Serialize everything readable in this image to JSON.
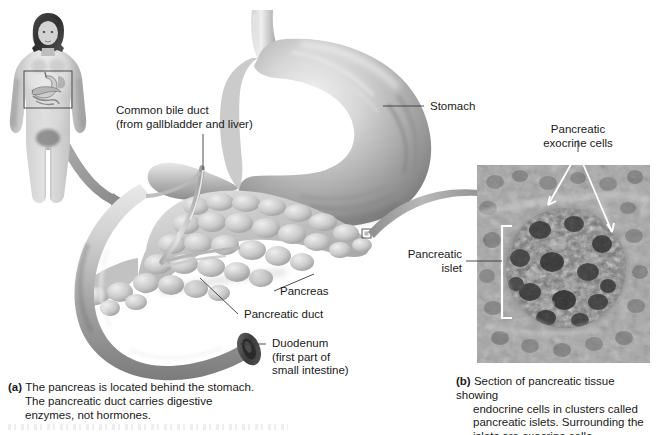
{
  "figure": {
    "background_color": "#ffffff",
    "width": 656,
    "height": 435
  },
  "panel_a": {
    "labels": [
      {
        "name": "common-bile-duct",
        "lines": [
          "Common bile duct",
          "(from gallbladder and liver)"
        ],
        "text": "Common bile duct\n(from gallbladder and liver)"
      },
      {
        "name": "stomach",
        "lines": [
          "Stomach"
        ],
        "text": "Stomach"
      },
      {
        "name": "pancreas",
        "lines": [
          "Pancreas"
        ],
        "text": "Pancreas"
      },
      {
        "name": "pancreatic-duct",
        "lines": [
          "Pancreatic duct"
        ],
        "text": "Pancreatic duct"
      },
      {
        "name": "duodenum",
        "lines": [
          "Duodenum",
          "(first part of",
          "small intestine)"
        ],
        "text": "Duodenum\n(first part of\nsmall intestine)"
      }
    ],
    "caption": {
      "letter": "(a)",
      "line1": "The pancreas is located behind the stomach.",
      "line2": "The pancreatic duct carries digestive",
      "line3": "enzymes, not hormones."
    },
    "body_figure": {
      "name": "human-body-diagram",
      "description": "Grayscale full-body female figure with abdominal inset box and curved arrow"
    }
  },
  "panel_b": {
    "labels": [
      {
        "name": "pancreatic-exocrine-cells",
        "lines": [
          "Pancreatic",
          "exocrine cells"
        ],
        "text": "Pancreatic\nexocrine cells"
      },
      {
        "name": "pancreatic-islet",
        "lines": [
          "Pancreatic",
          "islet"
        ],
        "text": "Pancreatic\nislet"
      }
    ],
    "micrograph": {
      "name": "pancreas-histology-micrograph",
      "description": "Grayscale light micrograph of pancreatic tissue with a central islet"
    },
    "caption": {
      "letter": "(b)",
      "line1": "Section of pancreatic tissue showing",
      "line2": "endocrine cells in clusters called",
      "line3": "pancreatic islets. Surrounding the",
      "line4": "islets are exocrine cells."
    }
  },
  "colors": {
    "text": "#1a1a1a",
    "leader_line": "#3a3a3a",
    "tissue_light": "#d8d8d8",
    "tissue_mid": "#a8a8a8",
    "tissue_dark": "#6e6e6e",
    "micrograph_base": "#9a9a9a",
    "arrow_gray": "#9b9b9b"
  }
}
